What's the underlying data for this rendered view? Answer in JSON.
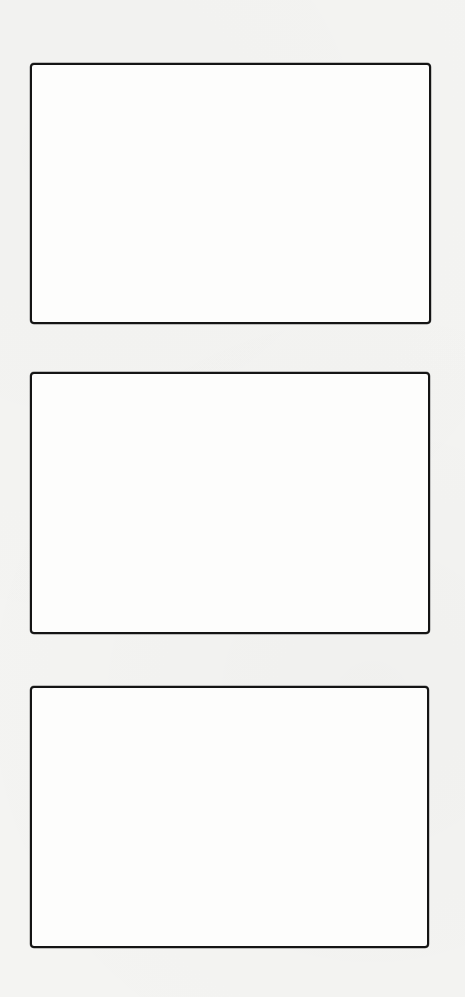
{
  "page": {
    "type": "storyboard-template",
    "background_color": "#f4f4f2",
    "panel_fill_color": "#fdfdfc",
    "border_color": "#141414",
    "panel_count": 3
  },
  "panels": [
    {
      "index": 1,
      "content": "",
      "x": 30,
      "y": 63,
      "width": 401,
      "height": 261
    },
    {
      "index": 2,
      "content": "",
      "x": 30,
      "y": 372,
      "width": 400,
      "height": 262
    },
    {
      "index": 3,
      "content": "",
      "x": 30,
      "y": 686,
      "width": 399,
      "height": 262
    }
  ]
}
